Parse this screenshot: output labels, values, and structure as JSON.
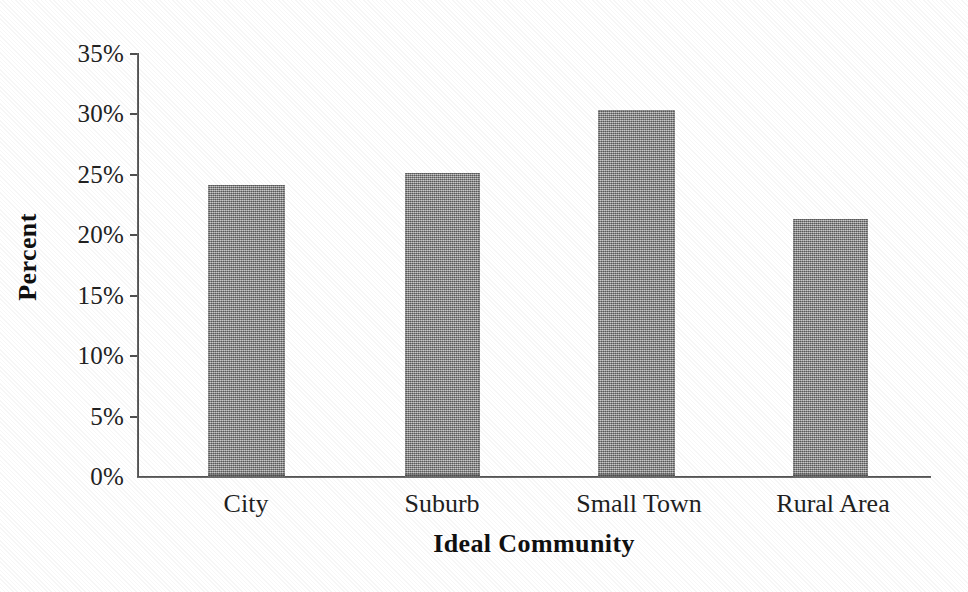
{
  "chart_data": {
    "type": "bar",
    "title": "",
    "subtitle": "",
    "xlabel": "Ideal Community",
    "ylabel": "Percent",
    "categories": [
      "City",
      "Suburb",
      "Small Town",
      "Rural Area"
    ],
    "values": [
      24.1,
      25.1,
      30.3,
      21.3
    ],
    "value_labels": [
      "24.1%",
      "25.1%",
      "30.3%",
      "21.3%"
    ],
    "series": [
      {
        "name": "Percent",
        "values": [
          24.1,
          25.1,
          30.3,
          21.3
        ]
      }
    ],
    "ylim": [
      0,
      35
    ],
    "ytick_values": [
      35,
      30,
      25,
      20,
      15,
      10,
      5,
      0
    ],
    "ytick_labels": [
      "35%",
      "30%",
      "25%",
      "20%",
      "15%",
      "10%",
      "5%",
      "0%"
    ],
    "grid": false,
    "legend": false,
    "legend_position": "none",
    "bar_color": "#8d8d8d",
    "axis_color": "#4f4f4f",
    "background_color": "#ffffff",
    "text_color": "#1a1a1a"
  },
  "figure": {
    "x_axis_title": "Ideal Community",
    "y_axis_title": "Percent"
  }
}
